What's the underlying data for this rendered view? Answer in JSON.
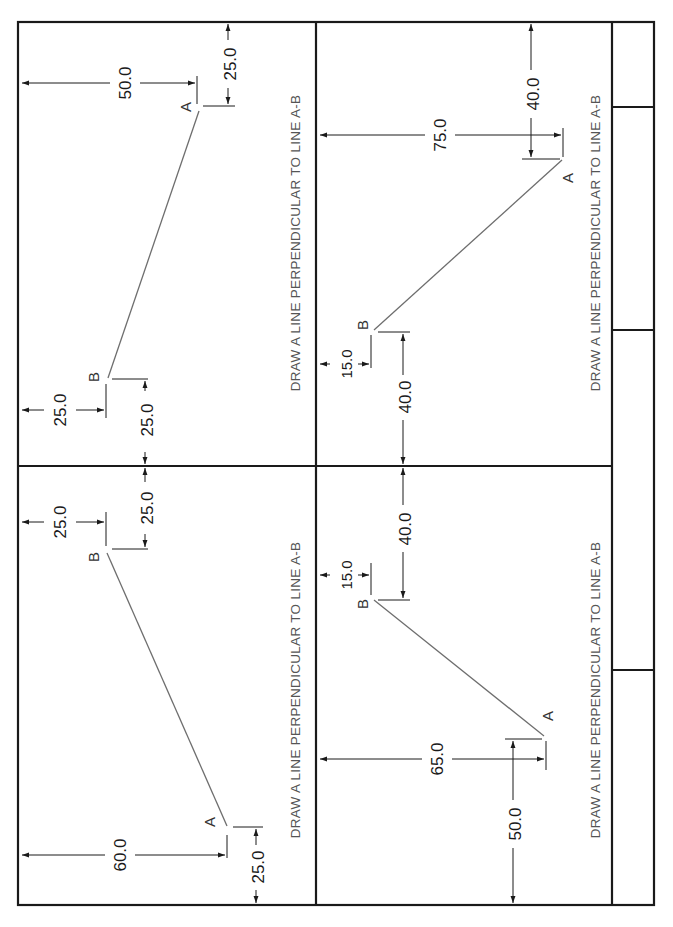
{
  "sheet": {
    "type": "drafting worksheet (rotated 90° CCW)",
    "border_color": "#1a1a1a",
    "line_color": "#6e6e6e",
    "text_color": "#555555"
  },
  "problems": [
    {
      "id": "top-left",
      "instruction": "DRAW A LINE PERPENDICULAR TO LINE A-B",
      "point_a": {
        "label": "A",
        "dims": [
          "50.0",
          "25.0"
        ]
      },
      "point_b": {
        "label": "B",
        "dims": [
          "25.0",
          "25.0"
        ]
      }
    },
    {
      "id": "top-right",
      "instruction": "DRAW A LINE PERPENDICULAR TO LINE A-B",
      "point_a": {
        "label": "A",
        "dims": [
          "75.0",
          "40.0"
        ]
      },
      "point_b": {
        "label": "B",
        "dims": [
          "15.0",
          "40.0"
        ]
      }
    },
    {
      "id": "bottom-left",
      "instruction": "DRAW A LINE PERPENDICULAR TO LINE A-B",
      "point_a": {
        "label": "A",
        "dims": [
          "60.0",
          "25.0"
        ]
      },
      "point_b": {
        "label": "B",
        "dims": [
          "25.0",
          "25.0"
        ]
      }
    },
    {
      "id": "bottom-right",
      "instruction": "DRAW A LINE PERPENDICULAR TO LINE A-B",
      "point_a": {
        "label": "A",
        "dims": [
          "65.0",
          "50.0"
        ]
      },
      "point_b": {
        "label": "B",
        "dims": [
          "15.0",
          "40.0"
        ]
      }
    }
  ],
  "title_block": {
    "cells": 4
  }
}
